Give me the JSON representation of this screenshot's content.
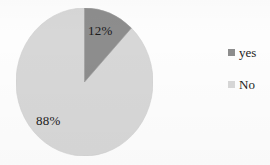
{
  "chart_data": {
    "type": "pie",
    "title": "",
    "subtitle": "",
    "xlabel": "",
    "ylabel": "",
    "grid": false,
    "legend_position": "right",
    "start_angle_deg": 0,
    "direction": "clockwise",
    "categories": [
      "yes",
      "No"
    ],
    "values": [
      12,
      88
    ],
    "value_unit": "%",
    "data_labels": [
      "12%",
      "88%"
    ],
    "colors": [
      "#8d8d8d",
      "#d7d7d7"
    ],
    "slices": [
      {
        "label": "yes",
        "value": 12,
        "data_label": "12%",
        "color": "#8d8d8d",
        "start_deg": 0,
        "end_deg": 43.2
      },
      {
        "label": "No",
        "value": 88,
        "data_label": "88%",
        "color": "#d7d7d7",
        "start_deg": 43.2,
        "end_deg": 360
      }
    ],
    "legend": [
      {
        "label": "yes",
        "color": "#8d8d8d"
      },
      {
        "label": "No",
        "color": "#d7d7d7"
      }
    ]
  },
  "chart": {
    "slice_label_yes": "12%",
    "slice_label_no": "88%",
    "slice_color_yes": "#8d8d8d",
    "slice_color_no": "#d7d7d7",
    "outline_color": "#c9c9c9",
    "background_color": "#fdfdfd"
  },
  "legend": {
    "items": [
      {
        "label": "yes",
        "color": "#8d8d8d"
      },
      {
        "label": "No",
        "color": "#d7d7d7"
      }
    ]
  }
}
